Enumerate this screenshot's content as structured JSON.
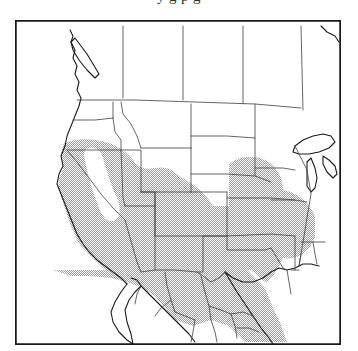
{
  "figure": {
    "kind": "distribution-range-map",
    "region_label": "Western United States and Mexico",
    "caption_remnant": "y  g        p g",
    "frame": {
      "x": 15,
      "y": 20,
      "width": 326,
      "height": 325,
      "border_color": "#1a1a1a",
      "background_color": "#ffffff"
    },
    "legend": {
      "shaded_label": "shaded distribution range",
      "shaded_color": "#c9c9c9",
      "unshaded_label": "outside range",
      "unshaded_color": "#ffffff"
    },
    "style": {
      "coastline_color": "#1a1a1a",
      "internal_border_color": "#4a4a4a",
      "shade_fill": "#c9c9c9",
      "shade_stipple": true
    },
    "areas": [
      {
        "name": "canada-british-columbia",
        "shaded": false
      },
      {
        "name": "canada-alberta",
        "shaded": false
      },
      {
        "name": "canada-saskatchewan",
        "shaded": false
      },
      {
        "name": "canada-manitoba",
        "shaded": false
      },
      {
        "name": "washington",
        "shaded": false
      },
      {
        "name": "oregon",
        "shaded": false
      },
      {
        "name": "idaho",
        "shaded": false
      },
      {
        "name": "montana",
        "shaded": false
      },
      {
        "name": "wyoming",
        "shaded": false
      },
      {
        "name": "north-dakota",
        "shaded": false
      },
      {
        "name": "south-dakota",
        "shaded": false
      },
      {
        "name": "nebraska",
        "shaded": false
      },
      {
        "name": "minnesota",
        "shaded": false
      },
      {
        "name": "iowa",
        "shaded": false
      },
      {
        "name": "missouri",
        "shaded": false
      },
      {
        "name": "wisconsin",
        "shaded": false
      },
      {
        "name": "illinois",
        "shaded": false
      },
      {
        "name": "california",
        "shaded": true
      },
      {
        "name": "nevada",
        "shaded": true
      },
      {
        "name": "utah",
        "shaded": true
      },
      {
        "name": "arizona",
        "shaded": true
      },
      {
        "name": "new-mexico",
        "shaded": true
      },
      {
        "name": "colorado",
        "shaded": true
      },
      {
        "name": "kansas",
        "shaded": true
      },
      {
        "name": "oklahoma",
        "shaded": true
      },
      {
        "name": "texas",
        "shaded": true
      },
      {
        "name": "arkansas",
        "shaded": true
      },
      {
        "name": "louisiana",
        "shaded": true
      },
      {
        "name": "sierra-nevada-gap",
        "shaded": false
      },
      {
        "name": "mexico-baja-california",
        "shaded": true
      },
      {
        "name": "mexico-sonora",
        "shaded": true
      },
      {
        "name": "mexico-chihuahua",
        "shaded": true
      },
      {
        "name": "mexico-coahuila",
        "shaded": true
      },
      {
        "name": "mexico-nuevo-leon",
        "shaded": true
      },
      {
        "name": "mexico-durango",
        "shaded": true
      },
      {
        "name": "mexico-sinaloa",
        "shaded": true
      },
      {
        "name": "mexico-zacatecas",
        "shaded": true
      },
      {
        "name": "mexico-jalisco",
        "shaded": true
      }
    ],
    "water_features": [
      {
        "name": "lake-superior"
      },
      {
        "name": "lake-michigan"
      },
      {
        "name": "lake-huron"
      },
      {
        "name": "gulf-of-california"
      },
      {
        "name": "gulf-of-mexico"
      },
      {
        "name": "pacific-ocean"
      }
    ]
  }
}
